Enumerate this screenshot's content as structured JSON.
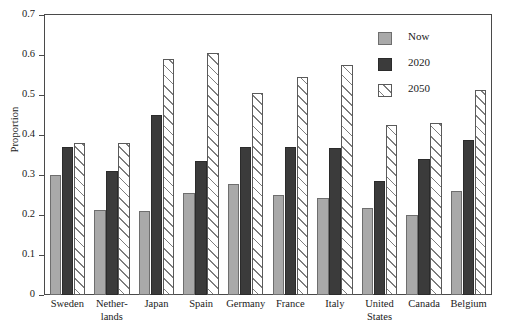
{
  "chart_data": {
    "type": "bar",
    "title": "",
    "xlabel": "",
    "ylabel": "Proportion",
    "ylim": [
      0,
      0.7
    ],
    "ytick_values": [
      0,
      0.1,
      0.2,
      0.3,
      0.4,
      0.5,
      0.6,
      0.7
    ],
    "ytick_labels": [
      "0",
      "0.1",
      "0.2",
      "0.3",
      "0.4",
      "0.5",
      "0.6",
      "0.7"
    ],
    "grid": false,
    "legend_position": "top-right",
    "categories": [
      "Sweden",
      "Nether-lands",
      "Japan",
      "Spain",
      "Germany",
      "France",
      "Italy",
      "United States",
      "Canada",
      "Belgium"
    ],
    "category_lines": [
      [
        "Sweden"
      ],
      [
        "Nether-",
        "lands"
      ],
      [
        "Japan"
      ],
      [
        "Spain"
      ],
      [
        "Germany"
      ],
      [
        "France"
      ],
      [
        "Italy"
      ],
      [
        "United",
        "States"
      ],
      [
        "Canada"
      ],
      [
        "Belgium"
      ]
    ],
    "series": [
      {
        "name": "Now",
        "color": "#a9a9a9",
        "values": [
          0.3,
          0.212,
          0.21,
          0.256,
          0.277,
          0.25,
          0.243,
          0.217,
          0.199,
          0.26
        ]
      },
      {
        "name": "2020",
        "color": "#3b3b3b",
        "values": [
          0.37,
          0.309,
          0.45,
          0.335,
          0.369,
          0.369,
          0.367,
          0.285,
          0.34,
          0.388
        ]
      },
      {
        "name": "2050",
        "color": "#ffffff",
        "values": [
          0.381,
          0.38,
          0.591,
          0.604,
          0.505,
          0.546,
          0.575,
          0.425,
          0.43,
          0.513
        ]
      }
    ]
  },
  "legend": {
    "items": [
      {
        "label": "Now",
        "style": "now"
      },
      {
        "label": "2020",
        "style": "y2020"
      },
      {
        "label": "2050",
        "style": "y2050"
      }
    ]
  }
}
